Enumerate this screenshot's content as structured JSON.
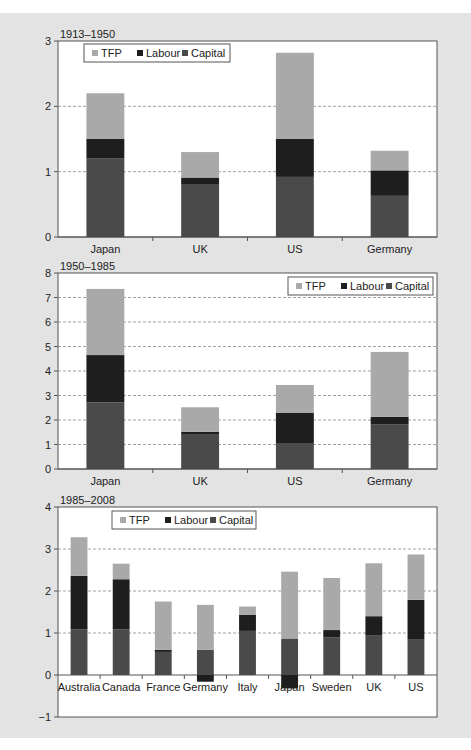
{
  "colors": {
    "panel_bg": "#e3e3e3",
    "plot_bg": "#ffffff",
    "axis": "#555555",
    "grid": "#888888",
    "TFP": "#a9a9a9",
    "Labour": "#1e1e1e",
    "Capital": "#4a4a4a"
  },
  "chart_data": [
    {
      "type": "bar",
      "stacked": true,
      "title": "1913–1950",
      "xlabel": "",
      "ylabel": "",
      "ylim": [
        0,
        3
      ],
      "yticks": [
        0,
        1,
        2,
        3
      ],
      "grid": true,
      "legend": {
        "entries": [
          "TFP",
          "Labour",
          "Capital"
        ],
        "position": "top-left"
      },
      "categories": [
        "Japan",
        "UK",
        "US",
        "Germany"
      ],
      "series": [
        {
          "name": "Capital",
          "values": [
            1.2,
            0.8,
            0.92,
            0.63
          ]
        },
        {
          "name": "Labour",
          "values": [
            0.3,
            0.11,
            0.58,
            0.39
          ]
        },
        {
          "name": "TFP",
          "values": [
            0.7,
            0.39,
            1.32,
            0.3
          ]
        }
      ],
      "layout": {
        "x": 58,
        "y": 41,
        "w": 379,
        "h": 196,
        "legend": {
          "x": 84,
          "y": 44,
          "w": 146,
          "h": 18
        }
      }
    },
    {
      "type": "bar",
      "stacked": true,
      "title": "1950–1985",
      "xlabel": "",
      "ylabel": "",
      "ylim": [
        0,
        8
      ],
      "yticks": [
        0,
        1,
        2,
        3,
        4,
        5,
        6,
        7,
        8
      ],
      "grid": true,
      "legend": {
        "entries": [
          "TFP",
          "Labour",
          "Capital"
        ],
        "position": "top-right"
      },
      "categories": [
        "Japan",
        "UK",
        "US",
        "Germany"
      ],
      "series": [
        {
          "name": "Capital",
          "values": [
            2.72,
            1.4,
            1.03,
            1.83
          ]
        },
        {
          "name": "Labour",
          "values": [
            1.93,
            0.12,
            1.27,
            0.3
          ]
        },
        {
          "name": "TFP",
          "values": [
            2.7,
            1.0,
            1.13,
            2.65
          ]
        }
      ],
      "layout": {
        "x": 58,
        "y": 273,
        "w": 379,
        "h": 196,
        "legend": {
          "x": 288,
          "y": 277,
          "w": 145,
          "h": 18
        }
      }
    },
    {
      "type": "bar",
      "stacked": true,
      "title": "1985–2008",
      "xlabel": "",
      "ylabel": "",
      "ylim": [
        -1,
        4
      ],
      "yticks": [
        -1,
        0,
        1,
        2,
        3,
        4
      ],
      "grid": true,
      "legend": {
        "entries": [
          "TFP",
          "Labour",
          "Capital"
        ],
        "position": "top-center"
      },
      "categories": [
        "Australia",
        "Canada",
        "France",
        "Germany",
        "Italy",
        "Japan",
        "Sweden",
        "UK",
        "US"
      ],
      "series": [
        {
          "name": "Capital",
          "values": [
            1.09,
            1.09,
            0.55,
            0.6,
            1.05,
            0.87,
            0.9,
            0.95,
            0.84
          ]
        },
        {
          "name": "Labour",
          "values": [
            1.27,
            1.19,
            0.05,
            -0.16,
            0.38,
            -0.32,
            0.17,
            0.45,
            0.95
          ]
        },
        {
          "name": "TFP",
          "values": [
            0.92,
            0.37,
            1.15,
            1.07,
            0.2,
            1.59,
            1.24,
            1.26,
            1.08
          ]
        }
      ],
      "layout": {
        "x": 58,
        "y": 507,
        "w": 379,
        "h": 210,
        "legend": {
          "x": 112,
          "y": 511,
          "w": 144,
          "h": 18
        }
      }
    }
  ]
}
